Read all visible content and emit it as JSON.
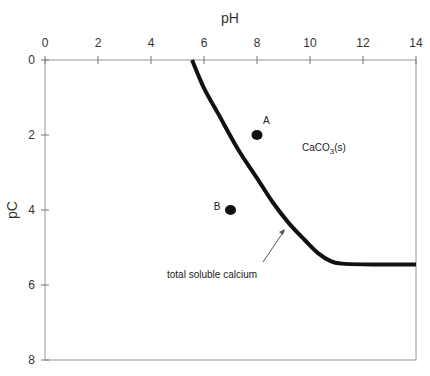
{
  "chart_data": {
    "type": "line",
    "title": "",
    "xlabel": "pH",
    "ylabel": "pC",
    "xlim": [
      0,
      14
    ],
    "ylim": [
      0,
      8
    ],
    "y_inverted": true,
    "x_axis_position": "top",
    "xticks": [
      0,
      2,
      4,
      6,
      8,
      10,
      12,
      14
    ],
    "yticks": [
      0,
      2,
      4,
      6,
      8
    ],
    "grid": false,
    "series": [
      {
        "name": "total soluble calcium",
        "x": [
          5.55,
          6.0,
          6.55,
          7.3,
          8.0,
          8.6,
          9.2,
          9.8,
          10.3,
          10.8,
          11.2,
          12.0,
          13.0,
          14.0
        ],
        "y": [
          0.0,
          0.75,
          1.45,
          2.4,
          3.15,
          3.8,
          4.35,
          4.8,
          5.15,
          5.37,
          5.43,
          5.45,
          5.45,
          5.45
        ]
      }
    ],
    "points": [
      {
        "label": "A",
        "x": 8.0,
        "y": 2.0
      },
      {
        "label": "B",
        "x": 7.0,
        "y": 4.0
      }
    ],
    "annotations": [
      {
        "text": "CaCO3(s)",
        "x": 10.5,
        "y": 2.3
      },
      {
        "text": "total soluble calcium",
        "x": 6.9,
        "y": 5.6,
        "arrow_to": [
          9.0,
          4.4
        ]
      }
    ]
  },
  "labels": {
    "xlabel": "pH",
    "ylabel": "pC",
    "point_a": "A",
    "point_b": "B",
    "region_main": "CaCO",
    "region_sub": "3",
    "region_suffix": "(s)",
    "curve_label": "total soluble calcium"
  }
}
